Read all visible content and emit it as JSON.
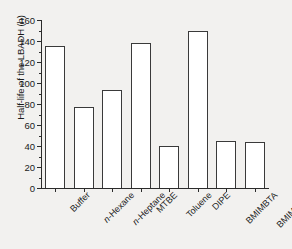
{
  "chart_data": {
    "type": "bar",
    "title": "",
    "xlabel": "",
    "ylabel": "Half-life of the LBADH (h)",
    "categories": [
      "Buffer",
      "n-Hexane",
      "n-Heptane",
      "MTBE",
      "Toluene",
      "DIPE",
      "BMIMBTA",
      "BMIM [PF6]"
    ],
    "category_labels_html": [
      "Buffer",
      "<i>n</i>-Hexane",
      "<i>n</i>-Heptane",
      "MTBE",
      "Toluene",
      "DIPE",
      "BMIMBTA",
      "BMIM [PF<sub>6</sub>]"
    ],
    "values": [
      135,
      77,
      93,
      138,
      40,
      150,
      44.5,
      43.5
    ],
    "ylim": [
      0,
      160
    ],
    "yticks": [
      0,
      20,
      40,
      60,
      80,
      100,
      120,
      140,
      160
    ],
    "ytick_labels": [
      "0",
      "20",
      "40",
      "60",
      "80",
      "100",
      "120",
      "140",
      "160"
    ],
    "y_minor_ticks": [
      10,
      30,
      50,
      70,
      90,
      110,
      130,
      150
    ],
    "grid": false,
    "legend": null,
    "bar_fill_color": "#ffffff",
    "bar_edge_color": "#3a3a3a",
    "axis_color": "#2b2b2b",
    "background_color": "#f2f1ef"
  }
}
